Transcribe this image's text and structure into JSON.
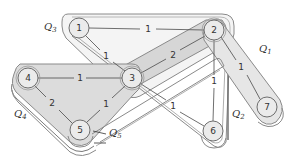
{
  "diagram": {
    "type": "hypergraph",
    "colors": {
      "background": "#ffffff",
      "band_fill": "#d9d9d9",
      "band_fill_light": "#eeeeee",
      "band_outline": "#8a8a8a",
      "node_fill": "#ebebeb",
      "edge": "#4a4a4a",
      "text": "#333333"
    },
    "nodes": [
      {
        "id": "1",
        "label": "1",
        "x": 79,
        "y": 28
      },
      {
        "id": "2",
        "label": "2",
        "x": 214,
        "y": 30
      },
      {
        "id": "3",
        "label": "3",
        "x": 132,
        "y": 78
      },
      {
        "id": "4",
        "label": "4",
        "x": 28,
        "y": 78
      },
      {
        "id": "5",
        "label": "5",
        "x": 80,
        "y": 130
      },
      {
        "id": "6",
        "label": "6",
        "x": 213,
        "y": 131
      },
      {
        "id": "7",
        "label": "7",
        "x": 267,
        "y": 107
      }
    ],
    "edges": [
      {
        "from": "1",
        "to": "2",
        "weight": "1",
        "label_x": 148,
        "label_y": 29
      },
      {
        "from": "1",
        "to": "3",
        "weight": "1",
        "label_x": 106,
        "label_y": 56
      },
      {
        "from": "2",
        "to": "3",
        "weight": "2",
        "label_x": 173,
        "label_y": 55
      },
      {
        "from": "2",
        "to": "7",
        "weight": "1",
        "label_x": 241,
        "label_y": 67
      },
      {
        "from": "2",
        "to": "6",
        "weight": "1",
        "label_x": 214,
        "label_y": 81
      },
      {
        "from": "3",
        "to": "4",
        "weight": "1",
        "label_x": 80,
        "label_y": 78
      },
      {
        "from": "3",
        "to": "5",
        "weight": "1",
        "label_x": 106,
        "label_y": 104
      },
      {
        "from": "3",
        "to": "6",
        "weight": "1",
        "label_x": 173,
        "label_y": 106
      },
      {
        "from": "4",
        "to": "5",
        "weight": "2",
        "label_x": 52,
        "label_y": 103
      }
    ],
    "hyperedges": [
      {
        "id": "Q1",
        "label": "Q",
        "sub": "1",
        "x": 259,
        "y": 52
      },
      {
        "id": "Q2",
        "label": "Q",
        "sub": "2",
        "x": 232,
        "y": 117
      },
      {
        "id": "Q3",
        "label": "Q",
        "sub": "3",
        "x": 44,
        "y": 30
      },
      {
        "id": "Q4",
        "label": "Q",
        "sub": "4",
        "x": 14,
        "y": 117
      },
      {
        "id": "Q5",
        "label": "Q",
        "sub": "5",
        "x": 109,
        "y": 136
      }
    ]
  }
}
